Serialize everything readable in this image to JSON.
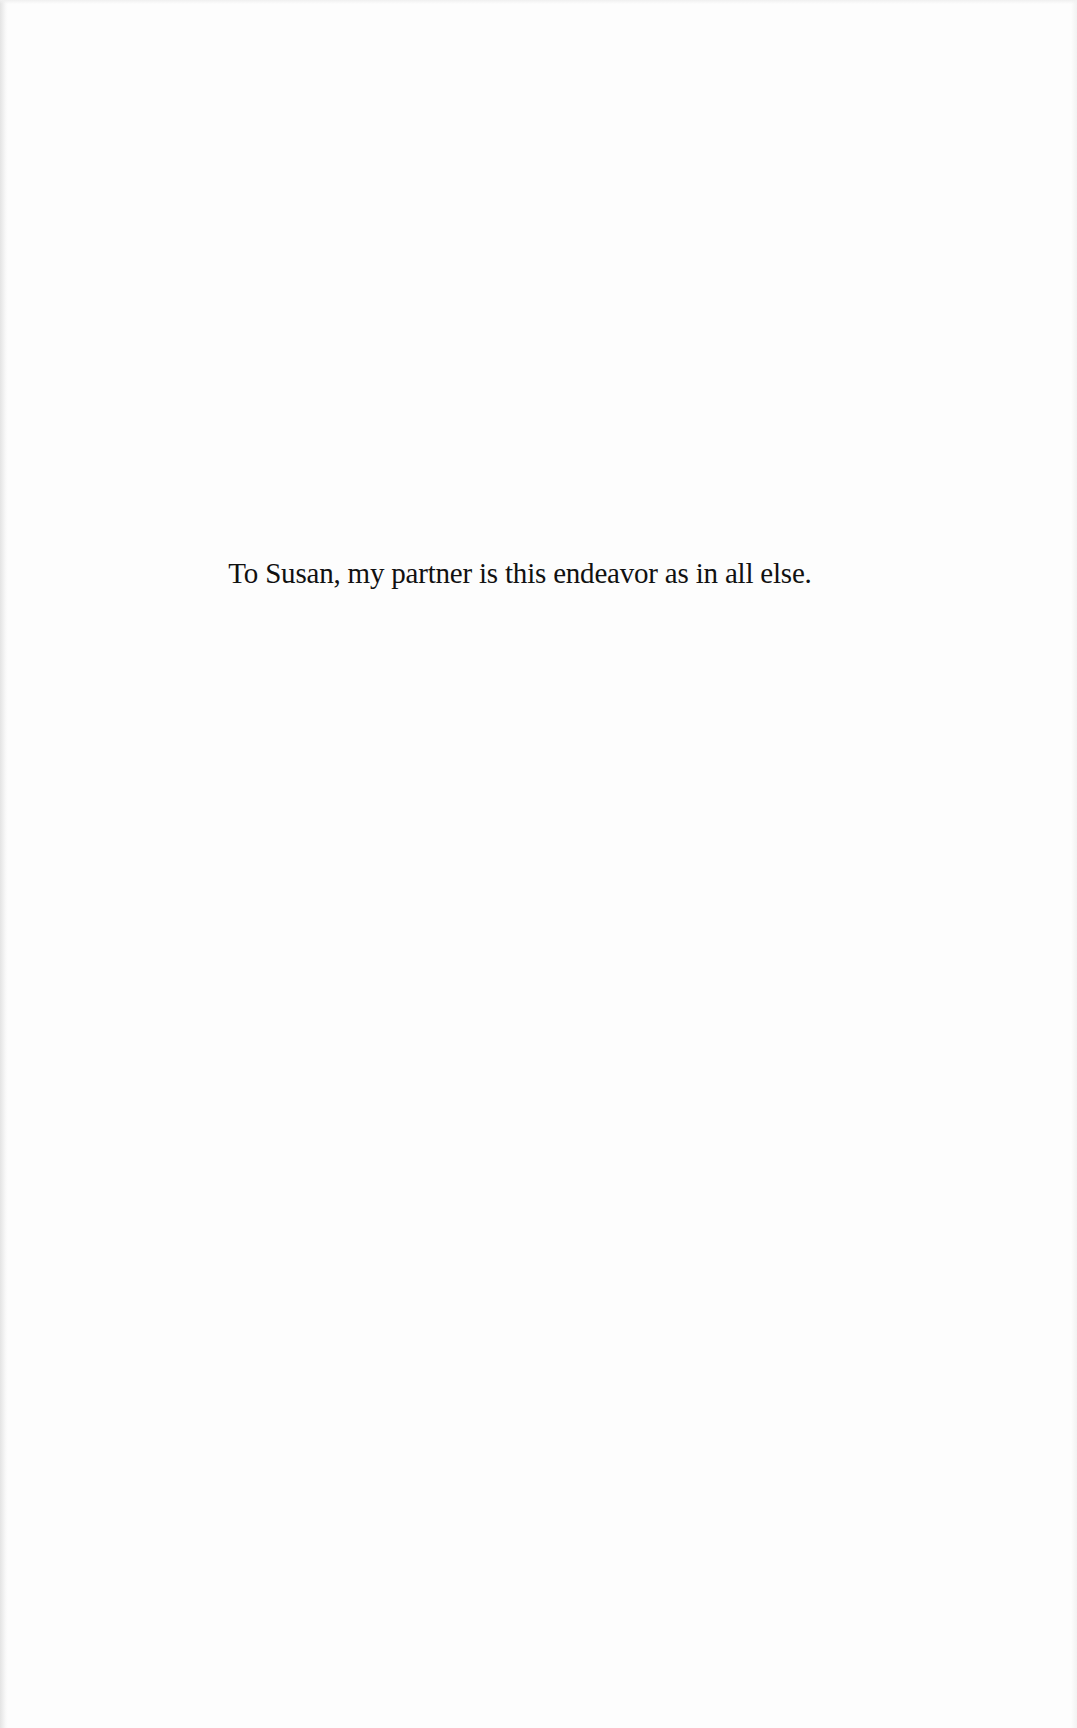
{
  "page": {
    "type": "book-dedication",
    "background_color": "#fdfdfd",
    "text_color": "#111111"
  },
  "dedication": {
    "text": "To Susan, my partner is this endeavor as in all else."
  }
}
